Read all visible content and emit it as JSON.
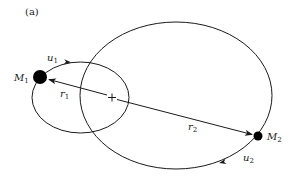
{
  "figure": {
    "panel_label": "(a)",
    "center_of_mass_marker": "+",
    "bodies": [
      {
        "name": "M1",
        "label_base": "M",
        "label_sub": "1",
        "velocity_base": "u",
        "velocity_sub": "1",
        "radius_base": "r",
        "radius_sub": "1"
      },
      {
        "name": "M2",
        "label_base": "M",
        "label_sub": "2",
        "velocity_base": "u",
        "velocity_sub": "2",
        "radius_base": "r",
        "radius_sub": "2"
      }
    ],
    "colors": {
      "ink": "#1a1a1a",
      "background": "#ffffff"
    }
  }
}
